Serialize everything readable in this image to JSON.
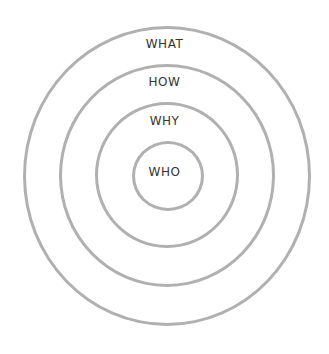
{
  "diagram": {
    "type": "concentric-circles",
    "rings": [
      {
        "label": "WHAT"
      },
      {
        "label": "HOW"
      },
      {
        "label": "WHY"
      },
      {
        "label": "WHO"
      }
    ],
    "ring_color": "#b0b0b0",
    "text_color": "#333333"
  }
}
